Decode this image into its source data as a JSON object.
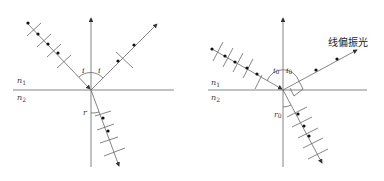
{
  "left_diagram": {
    "medium_top": "n",
    "medium_top_sub": "1",
    "medium_bottom": "n",
    "medium_bottom_sub": "2",
    "incident_angle": "i",
    "reflected_angle": "i",
    "refracted_angle": "r"
  },
  "right_diagram": {
    "medium_top": "n",
    "medium_top_sub": "1",
    "medium_bottom": "n",
    "medium_bottom_sub": "2",
    "incident_angle": "i",
    "incident_angle_sub": "0",
    "reflected_angle": "i",
    "reflected_angle_sub": "0",
    "refracted_angle": "r",
    "refracted_angle_sub": "0",
    "reflected_label": "线偏振光"
  },
  "colors": {
    "line": "#555555",
    "dot": "#111111"
  }
}
